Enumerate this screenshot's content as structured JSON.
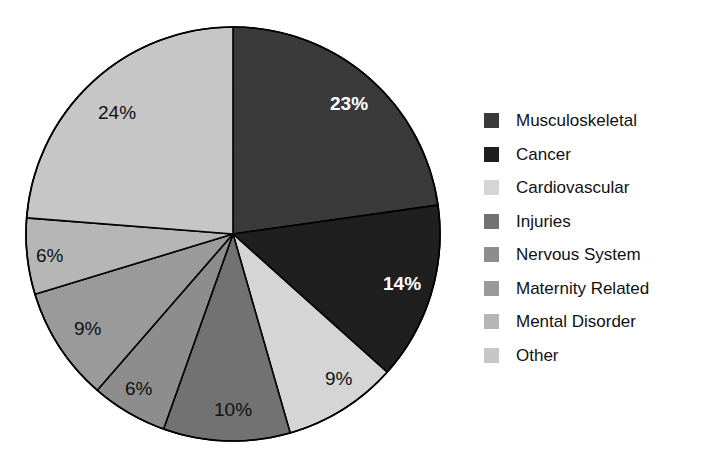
{
  "chart_data": {
    "type": "pie",
    "title": "",
    "subtitle": "",
    "xlabel": "",
    "ylabel": "",
    "legend_position": "right",
    "grid": false,
    "start_angle_deg": 0,
    "direction": "clockwise",
    "categories": [
      "Musculoskeletal",
      "Cancer",
      "Cardiovascular",
      "Injuries",
      "Nervous System",
      "Maternity Related",
      "Mental Disorder",
      "Other"
    ],
    "values": [
      23,
      14,
      9,
      10,
      6,
      9,
      6,
      24
    ],
    "value_labels": [
      "23%",
      "14%",
      "9%",
      "10%",
      "6%",
      "9%",
      "6%",
      "24%"
    ],
    "colors": [
      "#3a3a3a",
      "#1f1f1f",
      "#d5d5d5",
      "#727272",
      "#8d8d8d",
      "#9a9a9a",
      "#b6b6b6",
      "#c6c6c6"
    ],
    "slices": [
      {
        "label": "Musculoskeletal",
        "value": 23,
        "value_label": "23%",
        "color": "#3a3a3a",
        "label_color": "light"
      },
      {
        "label": "Cancer",
        "value": 14,
        "value_label": "14%",
        "color": "#1f1f1f",
        "label_color": "light"
      },
      {
        "label": "Cardiovascular",
        "value": 9,
        "value_label": "9%",
        "color": "#d5d5d5",
        "label_color": "dark"
      },
      {
        "label": "Injuries",
        "value": 10,
        "value_label": "10%",
        "color": "#727272",
        "label_color": "dark"
      },
      {
        "label": "Nervous System",
        "value": 6,
        "value_label": "6%",
        "color": "#8d8d8d",
        "label_color": "dark"
      },
      {
        "label": "Maternity Related",
        "value": 9,
        "value_label": "9%",
        "color": "#9a9a9a",
        "label_color": "dark"
      },
      {
        "label": "Mental Disorder",
        "value": 6,
        "value_label": "6%",
        "color": "#b6b6b6",
        "label_color": "dark"
      },
      {
        "label": "Other",
        "value": 24,
        "value_label": "24%",
        "color": "#c6c6c6",
        "label_color": "dark"
      }
    ]
  },
  "pie_geometry": {
    "center_x": 233,
    "center_y": 234,
    "radius": 207,
    "outline_color": "#000000",
    "outline_width": 1.6
  },
  "label_positions": [
    {
      "value_label": "23%",
      "x": 330,
      "y": 94
    },
    {
      "value_label": "14%",
      "x": 383,
      "y": 274
    },
    {
      "value_label": "9%",
      "x": 325,
      "y": 369
    },
    {
      "value_label": "10%",
      "x": 214,
      "y": 400
    },
    {
      "value_label": "6%",
      "x": 125,
      "y": 379
    },
    {
      "value_label": "9%",
      "x": 74,
      "y": 319
    },
    {
      "value_label": "6%",
      "x": 36,
      "y": 246
    },
    {
      "value_label": "24%",
      "x": 98,
      "y": 103
    }
  ],
  "legend": {
    "items": [
      {
        "label": "Musculoskeletal",
        "color": "#3a3a3a"
      },
      {
        "label": "Cancer",
        "color": "#1f1f1f"
      },
      {
        "label": "Cardiovascular",
        "color": "#d5d5d5"
      },
      {
        "label": "Injuries",
        "color": "#727272"
      },
      {
        "label": "Nervous System",
        "color": "#8d8d8d"
      },
      {
        "label": "Maternity Related",
        "color": "#9a9a9a"
      },
      {
        "label": "Mental Disorder",
        "color": "#b6b6b6"
      },
      {
        "label": "Other",
        "color": "#c6c6c6"
      }
    ]
  }
}
